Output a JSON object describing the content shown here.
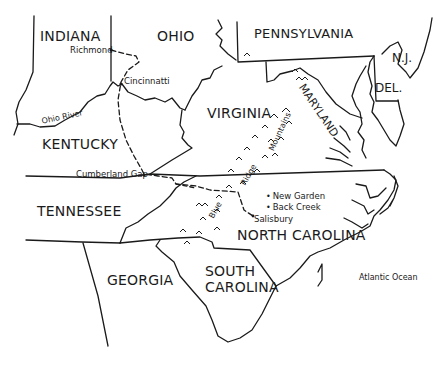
{
  "map": {
    "states": [
      {
        "name": "INDIANA",
        "x": 40,
        "y": 29
      },
      {
        "name": "OHIO",
        "x": 157,
        "y": 29
      },
      {
        "name": "PENNSYLVANIA",
        "x": 254,
        "y": 27
      },
      {
        "name": "N.J.",
        "x": 393,
        "y": 52
      },
      {
        "name": "DEL.",
        "x": 376,
        "y": 82
      },
      {
        "name": "VIRGINIA",
        "x": 207,
        "y": 106
      },
      {
        "name": "KENTUCKY",
        "x": 42,
        "y": 137
      },
      {
        "name": "TENNESSEE",
        "x": 37,
        "y": 204
      },
      {
        "name": "NORTH CAROLINA",
        "x": 237,
        "y": 228
      },
      {
        "name": "GEORGIA",
        "x": 107,
        "y": 273
      },
      {
        "name": "SOUTH",
        "x": 205,
        "y": 264
      },
      {
        "name": "CAROLINA",
        "x": 205,
        "y": 280
      }
    ],
    "maryland_label": "MARYLAND",
    "cities": [
      {
        "name": "Richmond",
        "x": 70,
        "y": 46
      },
      {
        "name": "Cincinnatti",
        "x": 124,
        "y": 77
      },
      {
        "name": "Cumberland Gap",
        "x": 76,
        "y": 171
      },
      {
        "name": "New Garden",
        "x": 268,
        "y": 195
      },
      {
        "name": "Back Creek",
        "x": 268,
        "y": 206
      },
      {
        "name": "Salisbury",
        "x": 253,
        "y": 218
      }
    ],
    "features": {
      "ohio_river": "Ohio River",
      "blue": "Blue",
      "ridge": "Ridge",
      "mountains": "Mountains",
      "atlantic": "Atlantic Ocean"
    },
    "colors": {
      "ink": "#1a1a1a",
      "background": "#ffffff"
    }
  }
}
